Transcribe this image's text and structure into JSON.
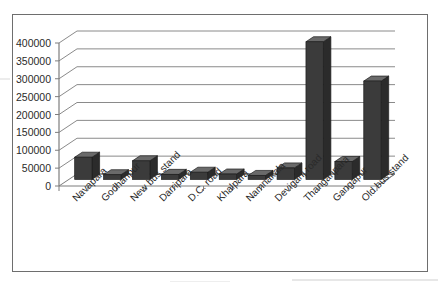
{
  "figure": {
    "name": "3d-bar-chart-scan",
    "background_color": "#ffffff",
    "frame_color": "#6e6e6e"
  },
  "chart_data": {
    "type": "bar",
    "title": "",
    "subtitle": "",
    "xlabel": "",
    "ylabel": "",
    "categories": [
      "Navapara",
      "Godhanpur",
      "New bus stand",
      "Darripara",
      "D.C. road",
      "Khalpara",
      "Namnakala",
      "Deviganj road",
      "Thanganpara",
      "Gangapur",
      "Old bus stand"
    ],
    "values": [
      62000,
      13000,
      52000,
      14000,
      20000,
      15000,
      11000,
      32000,
      385000,
      50000,
      275000
    ],
    "ylim": [
      0,
      400000
    ],
    "ytick_values": [
      0,
      50000,
      100000,
      150000,
      200000,
      250000,
      300000,
      350000,
      400000
    ],
    "ytick_labels": [
      "0",
      "50000",
      "100000",
      "150000",
      "200000",
      "250000",
      "300000",
      "350000",
      "400000"
    ],
    "grid": true,
    "grid_axis": "y",
    "legend": false,
    "legend_position": "none",
    "three_d": true,
    "bar_face_color": "#3b3b3b",
    "bar_top_color": "#6a6a6a",
    "bar_side_color": "#2b2b2b",
    "axis_color": "#7d7d7d",
    "grid_color": "#8a8a8a",
    "tick_label_color": "#2a2a2a",
    "category_label_rotation": -45
  }
}
